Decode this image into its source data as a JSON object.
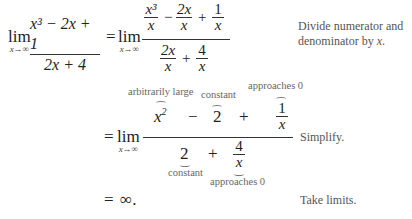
{
  "step1": {
    "lim_word": "lim",
    "lim_sub": "x→∞",
    "lhs": {
      "num": "x³ − 2x + 1",
      "den": "2x + 4"
    },
    "equals": "=",
    "rhs": {
      "num_terms": [
        {
          "num": "x³",
          "den": "x"
        },
        {
          "op": "−"
        },
        {
          "num": "2x",
          "den": "x"
        },
        {
          "op": "+"
        },
        {
          "num": "1",
          "den": "x"
        }
      ],
      "den_terms": [
        {
          "num": "2x",
          "den": "x"
        },
        {
          "op": "+"
        },
        {
          "num": "4",
          "den": "x"
        }
      ]
    },
    "note_line1": "Divide numerator and",
    "note_line2_prefix": "denominator by ",
    "note_line2_var": "x",
    "note_line2_suffix": "."
  },
  "step2": {
    "equals": "=",
    "lim_word": "lim",
    "lim_sub": "x→∞",
    "num": {
      "t1": "x",
      "t1_exp": "2",
      "op1": "−",
      "t2": "2",
      "op2": "+",
      "t3_num": "1",
      "t3_den": "x"
    },
    "den": {
      "t1": "2",
      "op1": "+",
      "t2_num": "4",
      "t2_den": "x"
    },
    "annotations": {
      "arbitrarily_large": "arbitrarily large",
      "constant_top": "constant",
      "approaches_top": "approaches 0",
      "constant_bottom": "constant",
      "approaches_bottom": "approaches 0"
    },
    "note": "Simplify."
  },
  "step3": {
    "equals": "=",
    "result": "∞",
    "period": ".",
    "note": "Take limits."
  }
}
